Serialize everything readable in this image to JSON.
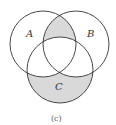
{
  "diagram": {
    "type": "venn",
    "sets": [
      {
        "label": "A",
        "cx": 43,
        "cy": 44,
        "r": 33
      },
      {
        "label": "B",
        "cx": 76,
        "cy": 44,
        "r": 33
      },
      {
        "label": "C",
        "cx": 60,
        "cy": 70,
        "r": 33
      }
    ],
    "shaded_regions": [
      "(A ∩ B) − C",
      "C − (A ∪ B)"
    ],
    "shade_color": "#d9d9d9",
    "stroke_color": "#333333",
    "caption": "(c)"
  }
}
